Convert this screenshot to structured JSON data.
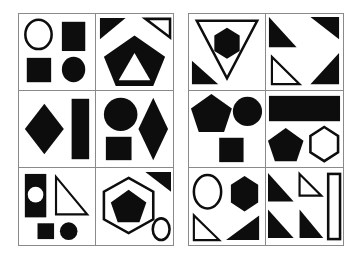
{
  "figure": {
    "title": "",
    "background_color": "#ffffff",
    "shape_fill_color": "#0d0d0d",
    "outline_color": "#0d0d0d",
    "grid_line_color": "#8a8a8a",
    "panel_count": 2,
    "grid_rows": 3,
    "grid_columns": 2
  },
  "panels": [
    {
      "name": "left-panel",
      "label": "",
      "cells": [
        {
          "name": "cell-left-1",
          "position": "row-1-col-1",
          "shapes": [
            {
              "kind": "circle",
              "style": "outline",
              "place": "top-left"
            },
            {
              "kind": "rectangle",
              "style": "filled",
              "place": "top-right"
            },
            {
              "kind": "square",
              "style": "filled",
              "place": "bottom-left"
            },
            {
              "kind": "ellipse",
              "style": "filled",
              "place": "bottom-right"
            }
          ]
        },
        {
          "name": "cell-left-2",
          "position": "row-1-col-2",
          "shapes": [
            {
              "kind": "triangle",
              "style": "filled",
              "place": "top-left"
            },
            {
              "kind": "triangle",
              "style": "outline",
              "place": "top-right"
            },
            {
              "kind": "pentagon",
              "style": "filled",
              "place": "center"
            },
            {
              "kind": "triangle",
              "style": "knockout",
              "place": "center"
            }
          ]
        },
        {
          "name": "cell-left-3",
          "position": "row-2-col-1",
          "shapes": [
            {
              "kind": "diamond",
              "style": "filled",
              "place": "left"
            },
            {
              "kind": "rectangle",
              "style": "filled",
              "place": "right"
            }
          ]
        },
        {
          "name": "cell-left-4",
          "position": "row-2-col-2",
          "shapes": [
            {
              "kind": "circle",
              "style": "filled",
              "place": "top-left"
            },
            {
              "kind": "square",
              "style": "filled",
              "place": "bottom-left"
            },
            {
              "kind": "diamond",
              "style": "filled",
              "place": "right"
            }
          ]
        },
        {
          "name": "cell-left-5",
          "position": "row-3-col-1",
          "shapes": [
            {
              "kind": "rectangle",
              "style": "filled",
              "place": "left"
            },
            {
              "kind": "circle",
              "style": "knockout",
              "place": "left"
            },
            {
              "kind": "triangle",
              "style": "outline",
              "place": "right"
            },
            {
              "kind": "square",
              "style": "filled",
              "place": "bottom-left"
            },
            {
              "kind": "circle",
              "style": "filled",
              "place": "bottom-right"
            }
          ]
        },
        {
          "name": "cell-left-6",
          "position": "row-3-col-2",
          "shapes": [
            {
              "kind": "triangle",
              "style": "filled",
              "place": "top-right"
            },
            {
              "kind": "hexagon",
              "style": "outline",
              "place": "center"
            },
            {
              "kind": "pentagon",
              "style": "filled",
              "place": "center"
            },
            {
              "kind": "ellipse",
              "style": "outline",
              "place": "bottom-right"
            }
          ]
        }
      ]
    },
    {
      "name": "right-panel",
      "label": "",
      "cells": [
        {
          "name": "cell-right-1",
          "position": "row-1-col-1",
          "shapes": [
            {
              "kind": "triangle-down",
              "style": "outline",
              "place": "center"
            },
            {
              "kind": "hexagon",
              "style": "filled",
              "place": "center"
            },
            {
              "kind": "triangle",
              "style": "filled",
              "place": "bottom-left"
            }
          ]
        },
        {
          "name": "cell-right-2",
          "position": "row-1-col-2",
          "shapes": [
            {
              "kind": "triangle",
              "style": "filled",
              "place": "top-left"
            },
            {
              "kind": "triangle",
              "style": "filled",
              "place": "top-right"
            },
            {
              "kind": "triangle",
              "style": "outline",
              "place": "bottom-left"
            },
            {
              "kind": "triangle",
              "style": "filled",
              "place": "bottom-right"
            }
          ]
        },
        {
          "name": "cell-right-3",
          "position": "row-2-col-1",
          "shapes": [
            {
              "kind": "pentagon",
              "style": "filled",
              "place": "top-left"
            },
            {
              "kind": "circle",
              "style": "filled",
              "place": "top-right"
            },
            {
              "kind": "square",
              "style": "filled",
              "place": "bottom-center"
            }
          ]
        },
        {
          "name": "cell-right-4",
          "position": "row-2-col-2",
          "shapes": [
            {
              "kind": "rectangle",
              "style": "filled",
              "place": "top"
            },
            {
              "kind": "pentagon",
              "style": "filled",
              "place": "bottom-left"
            },
            {
              "kind": "hexagon",
              "style": "outline",
              "place": "bottom-right"
            }
          ]
        },
        {
          "name": "cell-right-5",
          "position": "row-3-col-1",
          "shapes": [
            {
              "kind": "ellipse",
              "style": "outline",
              "place": "top-left"
            },
            {
              "kind": "hexagon",
              "style": "filled",
              "place": "top-right"
            },
            {
              "kind": "triangle",
              "style": "outline",
              "place": "bottom-left"
            },
            {
              "kind": "triangle",
              "style": "filled",
              "place": "bottom-right"
            }
          ]
        },
        {
          "name": "cell-right-6",
          "position": "row-3-col-2",
          "shapes": [
            {
              "kind": "triangle",
              "style": "filled",
              "place": "top-left"
            },
            {
              "kind": "triangle",
              "style": "outline",
              "place": "top-center"
            },
            {
              "kind": "rectangle",
              "style": "outline",
              "place": "right"
            },
            {
              "kind": "triangle",
              "style": "filled",
              "place": "bottom-left"
            },
            {
              "kind": "triangle",
              "style": "filled",
              "place": "bottom-center"
            }
          ]
        }
      ]
    }
  ]
}
